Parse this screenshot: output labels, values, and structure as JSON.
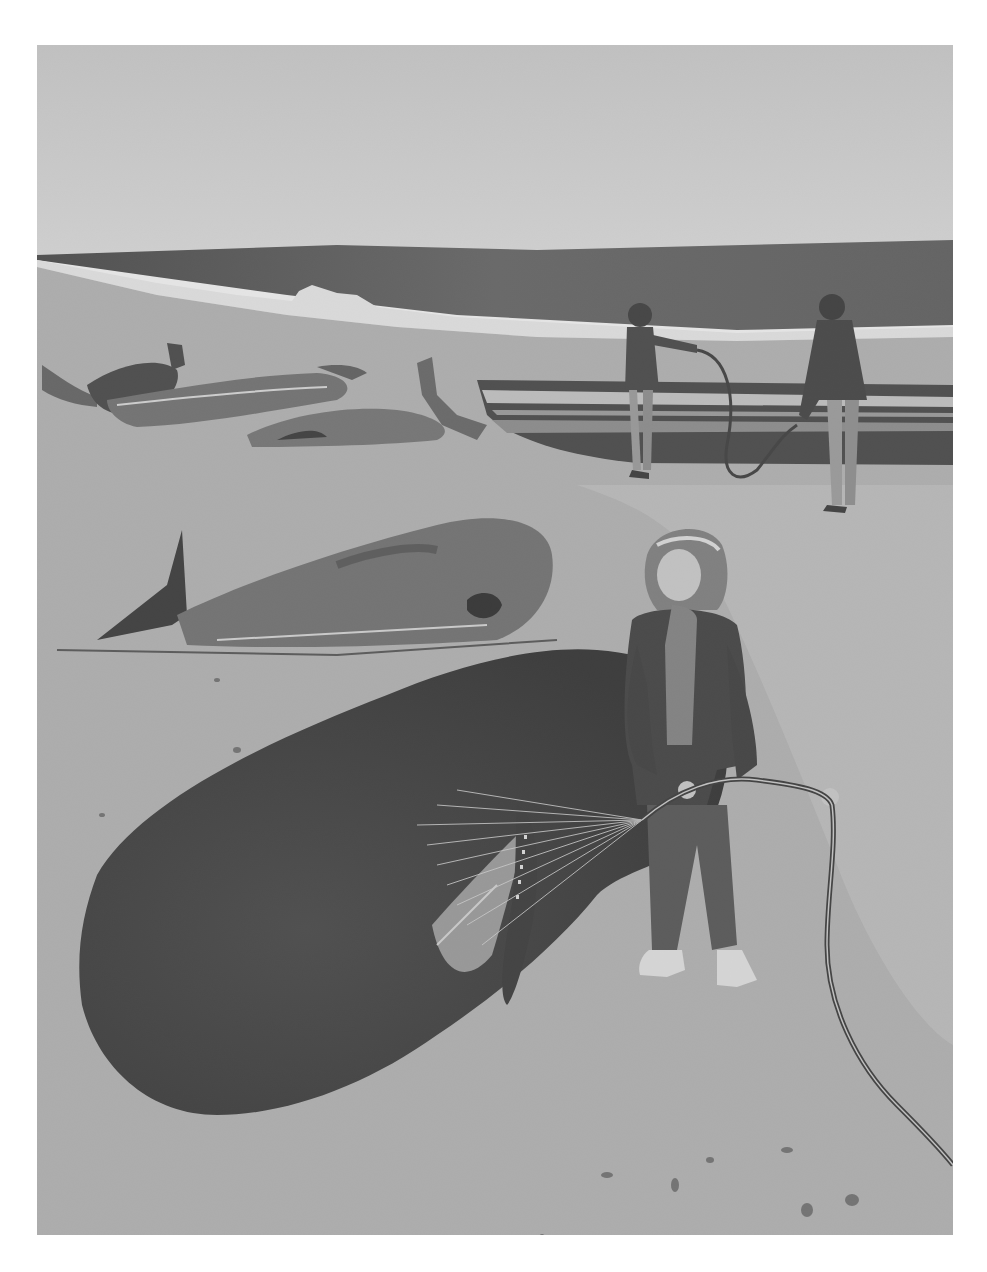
{
  "image": {
    "description": "Grayscale watercolor illustration of stranded whales on a beach; a child sprays water on a sperm whale with a hose while two adults with a hose stand near a rowboat in the background.",
    "palette": {
      "paper": "#ffffff",
      "sky": "#d6d6d6",
      "sea_dark": "#4a4a4a",
      "sea_mid": "#6e6e6e",
      "surf": "#f2f2f2",
      "sand": "#b3b3b3",
      "sand_wet": "#c6c6c6",
      "whale_dark": "#2e2e2e",
      "whale_mid": "#5a5a5a",
      "clothing": "#3a3a3a",
      "skin": "#cfcfcf"
    },
    "elements": [
      "sky",
      "ocean",
      "breaking-wave",
      "beach",
      "stranded-whales-background",
      "rowboat",
      "adult-with-hose-left",
      "adult-with-hose-right",
      "stranded-whale-middle",
      "sperm-whale-foreground",
      "child-with-hose",
      "water-spray",
      "garden-hose",
      "wet-spots"
    ]
  }
}
